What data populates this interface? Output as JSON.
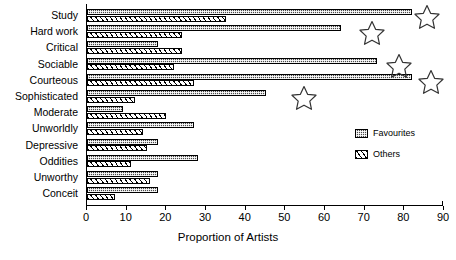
{
  "chart_data": {
    "type": "bar",
    "orientation": "horizontal",
    "title": "",
    "xlabel": "Proportion of Artists",
    "ylabel": "",
    "xlim": [
      0,
      90
    ],
    "xticks": [
      0,
      10,
      20,
      30,
      40,
      50,
      60,
      70,
      80,
      90
    ],
    "grid": false,
    "legend_position": "inside-right",
    "categories": [
      "Study",
      "Hard work",
      "Critical",
      "Sociable",
      "Courteous",
      "Sophisticated",
      "Moderate",
      "Unworldly",
      "Depressive",
      "Oddities",
      "Unworthy",
      "Conceit"
    ],
    "series": [
      {
        "name": "Favourites",
        "fill": "dark-checkered",
        "values": [
          82,
          64,
          18,
          73,
          82,
          45,
          9,
          27,
          18,
          28,
          18,
          18
        ]
      },
      {
        "name": "Others",
        "fill": "diagonal-hatch",
        "values": [
          35,
          24,
          24,
          22,
          27,
          12,
          20,
          14,
          15,
          11,
          16,
          7
        ]
      }
    ],
    "annotations": [
      {
        "marker": "star",
        "category": "Study",
        "x": 86
      },
      {
        "marker": "star",
        "category": "Hard work",
        "x": 72
      },
      {
        "marker": "star",
        "category": "Sociable",
        "x": 79
      },
      {
        "marker": "star",
        "category": "Courteous",
        "x": 87
      },
      {
        "marker": "star",
        "category": "Sophisticated",
        "x": 55
      }
    ]
  },
  "legend": {
    "items": [
      {
        "label": "Favourites"
      },
      {
        "label": "Others"
      }
    ]
  }
}
